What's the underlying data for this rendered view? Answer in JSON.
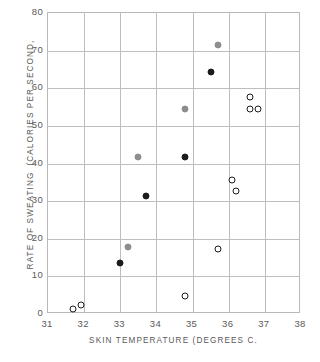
{
  "chart_data": {
    "type": "scatter",
    "title": "",
    "xlabel": "SKIN TEMPERATURE   (DEGREES C.",
    "ylabel_line1": "RATE OF SWEATING",
    "ylabel_line2": "(CALORIES PER SECOND,",
    "xlim": [
      31,
      38
    ],
    "ylim": [
      0,
      80
    ],
    "xticks": [
      31,
      32,
      33,
      34,
      35,
      36,
      37,
      38
    ],
    "yticks": [
      0,
      10,
      20,
      30,
      40,
      50,
      60,
      70,
      80
    ],
    "grid": true,
    "legend": "none",
    "series": [
      {
        "name": "filled-black",
        "marker": "filled circle",
        "color": "#1b1b1b",
        "points": [
          {
            "x": 33.0,
            "y": 13.6
          },
          {
            "x": 33.7,
            "y": 31.3
          },
          {
            "x": 34.8,
            "y": 41.8
          },
          {
            "x": 35.5,
            "y": 64.3
          }
        ]
      },
      {
        "name": "filled-grey",
        "marker": "filled circle",
        "color": "#8d8d8d",
        "points": [
          {
            "x": 33.2,
            "y": 17.8
          },
          {
            "x": 33.5,
            "y": 41.8
          },
          {
            "x": 34.8,
            "y": 54.4
          },
          {
            "x": 35.7,
            "y": 71.4
          }
        ]
      },
      {
        "name": "open",
        "marker": "open circle",
        "color": "#1b1b1b",
        "points": [
          {
            "x": 31.7,
            "y": 1.4
          },
          {
            "x": 31.9,
            "y": 2.3
          },
          {
            "x": 34.8,
            "y": 4.9
          },
          {
            "x": 35.7,
            "y": 17.4
          },
          {
            "x": 36.1,
            "y": 35.7
          },
          {
            "x": 36.2,
            "y": 32.7
          },
          {
            "x": 36.6,
            "y": 57.8
          },
          {
            "x": 36.6,
            "y": 54.6
          },
          {
            "x": 36.8,
            "y": 54.6
          }
        ]
      }
    ]
  }
}
